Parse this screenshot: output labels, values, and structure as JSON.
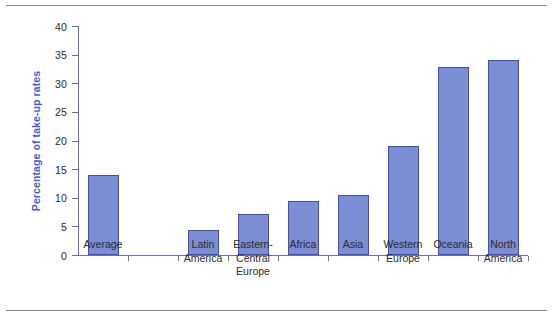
{
  "figure": {
    "background_color": "#ffffff",
    "rule_color": "#8a8a8a",
    "axis_color": "#6c6cc0",
    "bar_color": "#7b8dd4",
    "bar_border_color": "#4a4f97",
    "axis_title_color": "#4a5ec4",
    "tick_label_color": "#2b2b2b"
  },
  "chart_data": {
    "type": "bar",
    "title": "",
    "xlabel": "",
    "ylabel": "Percentage of take-up rates",
    "ylim": [
      0,
      40
    ],
    "yticks": [
      0,
      5,
      10,
      15,
      20,
      25,
      30,
      35,
      40
    ],
    "ytick_labels": [
      "0",
      "5",
      "10",
      "15",
      "20",
      "25",
      "30",
      "35",
      "40"
    ],
    "grid": false,
    "legend": false,
    "categories": [
      "Average",
      "",
      "Latin\nAmerica",
      "Eastern-\nCentral\nEurope",
      "Africa",
      "Asia",
      "Western\nEurope",
      "Oceania",
      "North\nAmerica"
    ],
    "values": [
      14,
      null,
      4.4,
      7.2,
      9.4,
      10.4,
      19,
      32.9,
      34
    ],
    "series": [
      {
        "name": "Percentage of take-up rates",
        "values": [
          14,
          null,
          4.4,
          7.2,
          9.4,
          10.4,
          19,
          32.9,
          34
        ]
      }
    ]
  }
}
